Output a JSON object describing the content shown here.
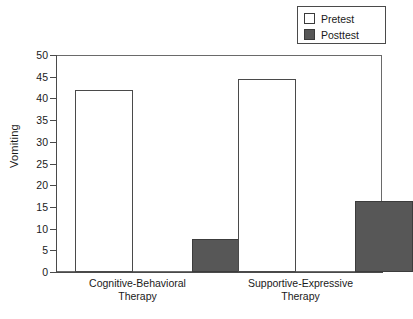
{
  "chart_data": {
    "type": "bar",
    "title": "",
    "xlabel": "",
    "ylabel": "Vomiting",
    "categories": [
      "Cognitive-Behavioral Therapy",
      "Supportive-Expressive Therapy"
    ],
    "category_lines": [
      [
        "Cognitive-Behavioral",
        "Therapy"
      ],
      [
        "Supportive-Expressive",
        "Therapy"
      ]
    ],
    "series": [
      {
        "name": "Pretest",
        "values": [
          42,
          44.5
        ],
        "color": "#ffffff"
      },
      {
        "name": "Posttest",
        "values": [
          7.5,
          16.3
        ],
        "color": "#575757"
      }
    ],
    "ylim": [
      0,
      50
    ],
    "ytick_step": 5,
    "yticks": [
      "0",
      "5",
      "10",
      "15",
      "20",
      "25",
      "30",
      "35",
      "40",
      "45",
      "50"
    ],
    "grid": false,
    "legend_position": "top-right",
    "legend_entries": [
      "Pretest",
      "Posttest"
    ]
  },
  "colors": {
    "axis": "#4a4a4a",
    "frame": "#6a6a6a",
    "posttest_fill": "#575757",
    "pretest_fill": "#ffffff",
    "background": "#ffffff",
    "text": "#1a1a1a"
  }
}
